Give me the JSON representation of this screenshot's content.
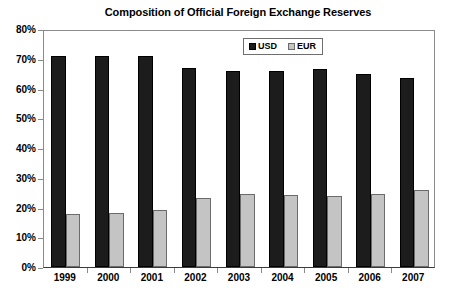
{
  "chart_data": {
    "type": "bar",
    "title": "Composition of Official Foreign Exchange Reserves",
    "xlabel": "",
    "ylabel": "",
    "categories": [
      "1999",
      "2000",
      "2001",
      "2002",
      "2003",
      "2004",
      "2005",
      "2006",
      "2007"
    ],
    "series": [
      {
        "name": "USD",
        "color": "#1c1c1c",
        "values": [
          71.0,
          71.0,
          71.0,
          66.9,
          65.9,
          65.9,
          66.4,
          65.0,
          63.5
        ]
      },
      {
        "name": "EUR",
        "color": "#c4c4c4",
        "values": [
          17.9,
          18.3,
          19.2,
          23.3,
          24.7,
          24.3,
          23.9,
          24.4,
          26.0
        ]
      }
    ],
    "ylim": [
      0,
      80
    ],
    "y_ticks": [
      0,
      10,
      20,
      30,
      40,
      50,
      60,
      70,
      80
    ],
    "y_tick_labels": [
      "0%",
      "10%",
      "20%",
      "30%",
      "40%",
      "50%",
      "60%",
      "70%",
      "80%"
    ],
    "grid": false,
    "legend_position": "top-right-inside",
    "legend": [
      "USD",
      "EUR"
    ]
  }
}
